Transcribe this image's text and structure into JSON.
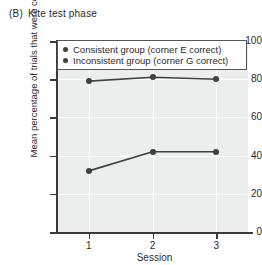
{
  "panel": {
    "tag": "(B)",
    "title": "Kite test phase"
  },
  "chart_data": {
    "type": "line",
    "xlabel": "Session",
    "ylabel": "Mean percentage of trials that were correct",
    "categories": [
      "1",
      "2",
      "3"
    ],
    "x": [
      1,
      2,
      3
    ],
    "xlim": [
      0.5,
      3.5
    ],
    "ylim": [
      0,
      100
    ],
    "yticks": [
      0,
      20,
      40,
      60,
      80,
      100
    ],
    "ytick_labels": [
      "0",
      "20",
      "40",
      "60",
      "80",
      "100"
    ],
    "xticks": [
      1,
      2,
      3
    ],
    "xtick_labels": [
      "1",
      "2",
      "3"
    ],
    "grid": "horizontal and vertical white gridlines on gray panel",
    "legend_position": "upper-left inside axes",
    "marker": "filled circle",
    "line_color": "#404040",
    "marker_color": "#404040",
    "panel_background": "#eceded",
    "series": [
      {
        "name": "Consistent group (corner E correct)",
        "values": [
          79,
          81,
          80
        ]
      },
      {
        "name": "Inconsistent group (corner G correct)",
        "values": [
          32,
          42,
          42
        ]
      }
    ]
  },
  "legend": {
    "items": [
      {
        "label": "Consistent group (corner E correct)"
      },
      {
        "label": "Inconsistent group (corner G correct)"
      }
    ]
  }
}
